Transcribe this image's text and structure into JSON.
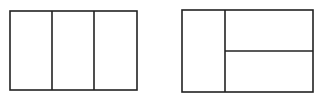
{
  "diagram": {
    "stroke_color": "#222222",
    "background": "#ffffff",
    "figures": [
      {
        "name": "rectangle-three-columns",
        "description": "Rectangle divided into three equal vertical parts",
        "outer": {
          "x": 10,
          "y": 11,
          "w": 127,
          "h": 79
        },
        "dividers": [
          {
            "x1": 52,
            "y1": 11,
            "x2": 52,
            "y2": 90
          },
          {
            "x1": 94,
            "y1": 11,
            "x2": 94,
            "y2": 90
          }
        ]
      },
      {
        "name": "rectangle-column-and-two-rows",
        "description": "Rectangle with a left column and the right part split into two rows",
        "outer": {
          "x": 182,
          "y": 10,
          "w": 131,
          "h": 82
        },
        "dividers": [
          {
            "x1": 225,
            "y1": 10,
            "x2": 225,
            "y2": 92
          },
          {
            "x1": 225,
            "y1": 51,
            "x2": 313,
            "y2": 51
          }
        ]
      }
    ]
  }
}
